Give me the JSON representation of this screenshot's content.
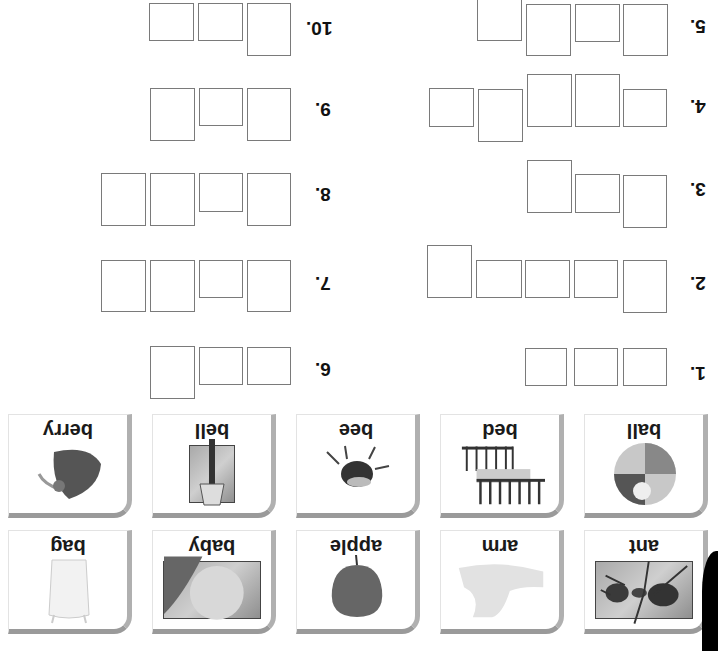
{
  "worksheet": {
    "orientation": "rotated 180 degrees",
    "questions": [
      {
        "label": "1.",
        "boxes": [
          [
            525,
            348,
            42,
            38
          ],
          [
            574,
            348,
            44,
            38
          ],
          [
            623,
            348,
            44,
            38
          ]
        ],
        "label_pos": [
          690,
          362
        ]
      },
      {
        "label": "2.",
        "boxes": [
          [
            427,
            245,
            45,
            53
          ],
          [
            476,
            260,
            46,
            38
          ],
          [
            525,
            260,
            45,
            38
          ],
          [
            574,
            260,
            44,
            38
          ],
          [
            623,
            260,
            44,
            53
          ]
        ],
        "label_pos": [
          690,
          272
        ]
      },
      {
        "label": "3.",
        "boxes": [
          [
            527,
            160,
            45,
            53
          ],
          [
            575,
            174,
            45,
            39
          ],
          [
            623,
            175,
            44,
            53
          ]
        ],
        "label_pos": [
          690,
          178
        ]
      },
      {
        "label": "4.",
        "boxes": [
          [
            429,
            88,
            45,
            39
          ],
          [
            478,
            89,
            45,
            53
          ],
          [
            527,
            74,
            45,
            53
          ],
          [
            575,
            74,
            45,
            53
          ],
          [
            623,
            89,
            44,
            38
          ]
        ],
        "label_pos": [
          690,
          95
        ]
      },
      {
        "label": "5.",
        "boxes": [
          [
            477,
            -2,
            45,
            43
          ],
          [
            526,
            4,
            45,
            52
          ],
          [
            575,
            4,
            45,
            38
          ],
          [
            623,
            4,
            45,
            52
          ]
        ],
        "label_pos": [
          690,
          15
        ]
      },
      {
        "label": "6.",
        "boxes": [
          [
            150,
            346,
            45,
            53
          ],
          [
            199,
            347,
            44,
            38
          ],
          [
            247,
            347,
            44,
            38
          ]
        ],
        "label_pos": [
          315,
          358
        ]
      },
      {
        "label": "7.",
        "boxes": [
          [
            101,
            260,
            45,
            52
          ],
          [
            150,
            260,
            45,
            52
          ],
          [
            199,
            260,
            44,
            38
          ],
          [
            247,
            260,
            44,
            52
          ]
        ],
        "label_pos": [
          315,
          272
        ]
      },
      {
        "label": "8.",
        "boxes": [
          [
            101,
            173,
            45,
            53
          ],
          [
            150,
            173,
            45,
            53
          ],
          [
            199,
            173,
            44,
            39
          ],
          [
            247,
            173,
            44,
            53
          ]
        ],
        "label_pos": [
          315,
          183
        ]
      },
      {
        "label": "9.",
        "boxes": [
          [
            150,
            88,
            45,
            53
          ],
          [
            199,
            88,
            44,
            38
          ],
          [
            247,
            88,
            44,
            53
          ]
        ],
        "label_pos": [
          315,
          98
        ]
      },
      {
        "label": "10.",
        "boxes": [
          [
            149,
            3,
            45,
            38
          ],
          [
            198,
            3,
            45,
            38
          ],
          [
            247,
            3,
            44,
            53
          ]
        ],
        "label_pos": [
          306,
          17
        ]
      }
    ]
  },
  "cards": [
    {
      "word": "berry",
      "icon": "strawberry-icon",
      "x": 8,
      "y": 414,
      "photo": false
    },
    {
      "word": "bell",
      "icon": "bell-icon",
      "x": 152,
      "y": 414,
      "photo": true
    },
    {
      "word": "bee",
      "icon": "bee-icon",
      "x": 296,
      "y": 414,
      "photo": false
    },
    {
      "word": "bed",
      "icon": "bed-icon",
      "x": 440,
      "y": 414,
      "photo": false
    },
    {
      "word": "ball",
      "icon": "beach-ball-icon",
      "x": 584,
      "y": 414,
      "photo": false
    },
    {
      "word": "bag",
      "icon": "bag-icon",
      "x": 8,
      "y": 530,
      "photo": false
    },
    {
      "word": "baby",
      "icon": "baby-icon",
      "x": 152,
      "y": 530,
      "photo": true
    },
    {
      "word": "apple",
      "icon": "apple-icon",
      "x": 296,
      "y": 530,
      "photo": false
    },
    {
      "word": "arm",
      "icon": "arm-icon",
      "x": 440,
      "y": 530,
      "photo": false
    },
    {
      "word": "ant",
      "icon": "ant-icon",
      "x": 584,
      "y": 530,
      "photo": true
    }
  ]
}
